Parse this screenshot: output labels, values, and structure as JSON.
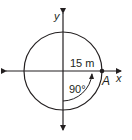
{
  "diagram": {
    "axes": {
      "x_label": "x",
      "y_label": "y"
    },
    "circle": {
      "radius_label": "15 m"
    },
    "angle_label": "90°",
    "point_label": "A",
    "colors": {
      "stroke": "#231f20",
      "background": "#ffffff"
    }
  }
}
